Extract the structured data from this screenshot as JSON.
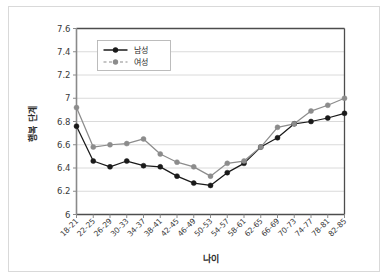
{
  "chart_data": {
    "type": "line",
    "title": "",
    "xlabel": "나이",
    "ylabel": "행복 단계",
    "ylim": [
      6,
      7.6
    ],
    "yticks": [
      "6",
      "6.2",
      "6.4",
      "6.6",
      "6.8",
      "7",
      "7.2",
      "7.4",
      "7.6"
    ],
    "ytick_values": [
      6,
      6.2,
      6.4,
      6.6,
      6.8,
      7,
      7.2,
      7.4,
      7.6
    ],
    "grid": "horizontal",
    "legend_position": "upper-left-inside",
    "categories": [
      "18-21",
      "22-25",
      "26-29",
      "30-33",
      "34-37",
      "38-41",
      "42-45",
      "46-49",
      "50-53",
      "54-57",
      "58-61",
      "62-65",
      "66-69",
      "70-73",
      "74-77",
      "78-81",
      "82-85"
    ],
    "series": [
      {
        "name": "남성",
        "color": "#1a1a1a",
        "marker": "circle-filled",
        "linestyle": "solid",
        "values": [
          6.76,
          6.46,
          6.41,
          6.46,
          6.42,
          6.41,
          6.33,
          6.27,
          6.25,
          6.36,
          6.44,
          6.58,
          6.66,
          6.78,
          6.8,
          6.83,
          6.87
        ]
      },
      {
        "name": "여성",
        "color": "#8c8c8c",
        "marker": "circle-filled",
        "linestyle": "dashed-legend",
        "values": [
          6.92,
          6.58,
          6.6,
          6.61,
          6.65,
          6.52,
          6.45,
          6.41,
          6.33,
          6.44,
          6.46,
          6.58,
          6.75,
          6.78,
          6.89,
          6.94,
          7.0
        ]
      }
    ]
  },
  "legend": {
    "entries": [
      {
        "label": "남성"
      },
      {
        "label": "여성"
      }
    ]
  },
  "colors": {
    "male": "#1a1a1a",
    "female": "#8c8c8c",
    "grid": "#d0d0d0",
    "axis": "#595959",
    "frame": "#d9d9d9",
    "text": "#3a3a3a"
  }
}
